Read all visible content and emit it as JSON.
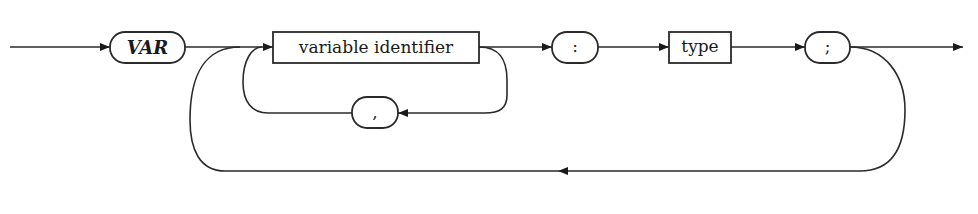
{
  "diagram": {
    "kind": "syntax-diagram",
    "rule": "variable declaration",
    "nodes": {
      "var_keyword": {
        "label": "VAR",
        "shape": "rounded",
        "style": "bold-italic"
      },
      "variable_identifier": {
        "label": "variable identifier",
        "shape": "rectangle"
      },
      "comma": {
        "label": ",",
        "shape": "rounded"
      },
      "colon": {
        "label": ":",
        "shape": "rounded"
      },
      "type": {
        "label": "type",
        "shape": "rectangle"
      },
      "semicolon": {
        "label": ";",
        "shape": "rounded"
      }
    },
    "flow": [
      "start",
      "VAR",
      "variable identifier",
      ":",
      "type",
      ";",
      "end"
    ],
    "loops": [
      {
        "from": "variable identifier",
        "via": ",",
        "to": "variable identifier"
      },
      {
        "from": ";",
        "to": "variable identifier"
      }
    ],
    "colors": {
      "stroke": "#2a2a2a",
      "text": "#1a1a1a",
      "background": "#ffffff"
    }
  }
}
